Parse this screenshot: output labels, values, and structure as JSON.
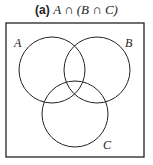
{
  "caption": {
    "tag": "(a)",
    "expression": "A ∩ (B ∩ C)"
  },
  "diagram": {
    "type": "venn",
    "universe": {
      "x": 6,
      "y": 23,
      "width": 138,
      "height": 134
    },
    "sets": [
      {
        "label": "A",
        "cx": 52,
        "cy": 70,
        "r": 33,
        "label_x": 14,
        "label_y": 47
      },
      {
        "label": "B",
        "cx": 97,
        "cy": 70,
        "r": 33,
        "label_x": 125,
        "label_y": 47
      },
      {
        "label": "C",
        "cx": 75,
        "cy": 114,
        "r": 33,
        "label_x": 103,
        "label_y": 149
      }
    ],
    "stroke_color": "#222222"
  }
}
